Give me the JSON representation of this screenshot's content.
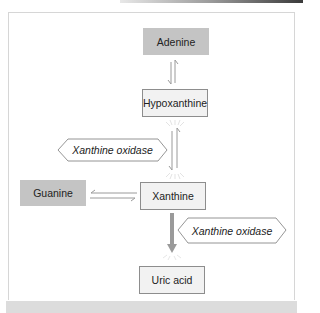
{
  "diagram": {
    "nodes": {
      "adenine": "Adenine",
      "hypoxanthine": "Hypoxanthine",
      "guanine": "Guanine",
      "xanthine": "Xanthine",
      "uric_acid": "Uric acid"
    },
    "enzymes": {
      "enzyme1": "Xanthine oxidase",
      "enzyme2": "Xanthine oxidase"
    },
    "edges": [
      {
        "from": "Adenine",
        "to": "Hypoxanthine",
        "type": "reversible"
      },
      {
        "from": "Hypoxanthine",
        "to": "Xanthine",
        "type": "reversible",
        "enzyme": "Xanthine oxidase"
      },
      {
        "from": "Guanine",
        "to": "Xanthine",
        "type": "reversible"
      },
      {
        "from": "Xanthine",
        "to": "Uric acid",
        "type": "irreversible",
        "enzyme": "Xanthine oxidase"
      }
    ],
    "colors": {
      "shaded_box": "#c4c4c4",
      "light_box": "#f2f2f2",
      "arrow": "#9a9a9a"
    }
  }
}
